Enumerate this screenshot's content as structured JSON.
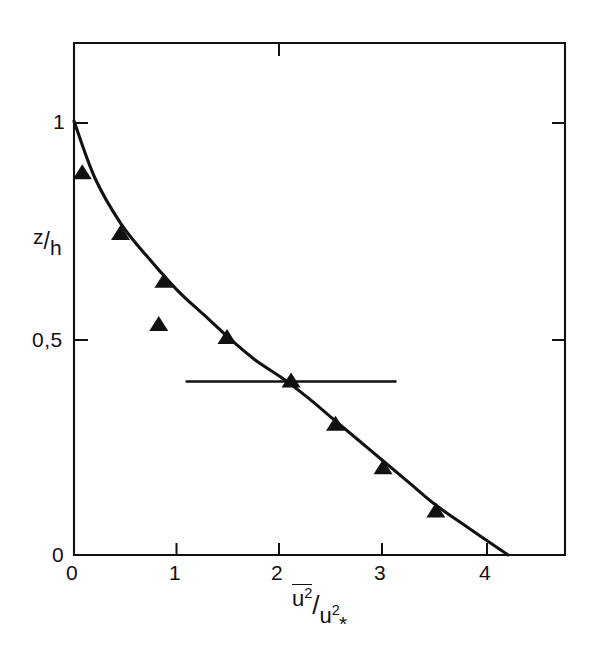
{
  "chart_data": {
    "type": "scatter",
    "title": "",
    "subtitle": "",
    "xlabel": "u² / uₓ²",
    "xlabel_parts": {
      "numerator": "u",
      "numerator_exp": "2",
      "numerator_overbar": true,
      "denominator": "u",
      "denominator_exp": "2",
      "denominator_sub": "*"
    },
    "ylabel": "z/h",
    "ylabel_parts": {
      "numerator": "z",
      "denominator": "h"
    },
    "xlim": [
      0,
      4.75
    ],
    "ylim": [
      0,
      1.18
    ],
    "xticks": [
      0,
      1,
      2,
      3,
      4
    ],
    "xticklabels": [
      "0",
      "1",
      "2",
      "3",
      "4"
    ],
    "yticks": [
      0,
      0.5,
      1
    ],
    "yticklabels": [
      "0",
      "0,5",
      "1"
    ],
    "grid": false,
    "legend": false,
    "legend_position": "none",
    "marker": "filled-triangle",
    "marker_color": "#111111",
    "line_color": "#111111",
    "frame": "box",
    "series": [
      {
        "name": "measurements",
        "marker": "filled-triangle",
        "points": [
          {
            "x": 0.08,
            "y": 0.88
          },
          {
            "x": 0.45,
            "y": 0.74
          },
          {
            "x": 0.87,
            "y": 0.63
          },
          {
            "x": 0.82,
            "y": 0.53
          },
          {
            "x": 1.48,
            "y": 0.5
          },
          {
            "x": 2.1,
            "y": 0.4
          },
          {
            "x": 2.53,
            "y": 0.3
          },
          {
            "x": 2.99,
            "y": 0.2
          },
          {
            "x": 3.5,
            "y": 0.1
          }
        ]
      },
      {
        "name": "fitted-curve",
        "type": "line",
        "points": [
          {
            "x": 0.0,
            "y": 1.0
          },
          {
            "x": 0.2,
            "y": 0.87
          },
          {
            "x": 0.45,
            "y": 0.765
          },
          {
            "x": 0.7,
            "y": 0.69
          },
          {
            "x": 1.0,
            "y": 0.61
          },
          {
            "x": 1.25,
            "y": 0.555
          },
          {
            "x": 1.5,
            "y": 0.5
          },
          {
            "x": 1.75,
            "y": 0.45
          },
          {
            "x": 2.0,
            "y": 0.41
          },
          {
            "x": 2.25,
            "y": 0.365
          },
          {
            "x": 2.5,
            "y": 0.315
          },
          {
            "x": 2.75,
            "y": 0.265
          },
          {
            "x": 3.0,
            "y": 0.215
          },
          {
            "x": 3.25,
            "y": 0.165
          },
          {
            "x": 3.5,
            "y": 0.115
          },
          {
            "x": 3.8,
            "y": 0.065
          },
          {
            "x": 4.2,
            "y": 0.0
          }
        ]
      }
    ],
    "annotations": [
      {
        "name": "horizontal-reference-line",
        "type": "hline",
        "y": 0.4,
        "x_start": 1.08,
        "x_end": 3.12
      }
    ]
  }
}
